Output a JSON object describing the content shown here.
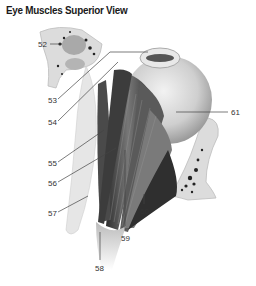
{
  "title": "Eye Muscles Superior View",
  "labels": [
    {
      "id": "52",
      "text": "52",
      "x": 38,
      "y": 40
    },
    {
      "id": "53",
      "text": "53",
      "x": 48,
      "y": 97
    },
    {
      "id": "54",
      "text": "54",
      "x": 48,
      "y": 119
    },
    {
      "id": "55",
      "text": "55",
      "x": 48,
      "y": 160
    },
    {
      "id": "56",
      "text": "56",
      "x": 48,
      "y": 180
    },
    {
      "id": "57",
      "text": "57",
      "x": 48,
      "y": 210
    },
    {
      "id": "58",
      "text": "58",
      "x": 95,
      "y": 266
    },
    {
      "id": "59",
      "text": "59",
      "x": 122,
      "y": 236
    },
    {
      "id": "60",
      "text": "60",
      "x": 140,
      "y": 209
    },
    {
      "id": "61",
      "text": "61",
      "x": 232,
      "y": 110
    }
  ],
  "colors": {
    "bone": "#dcdcdc",
    "bone_edge": "#bdbdbd",
    "muscle_dark": "#3a3a3a",
    "muscle_mid": "#6e6e6e",
    "eyeball": "#c9c9c9",
    "leader_line": "#444444"
  }
}
